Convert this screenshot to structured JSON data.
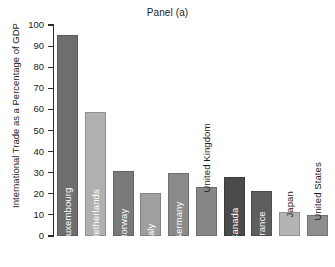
{
  "chart_data": {
    "type": "bar",
    "title": "Panel (a)",
    "xlabel": "",
    "ylabel": "International Trade as a Percentage of GDP",
    "ylim": [
      0,
      100
    ],
    "ytick_step": 10,
    "yticks": [
      100,
      90,
      80,
      70,
      60,
      50,
      40,
      30,
      20,
      10,
      0
    ],
    "grid": false,
    "legend": "none",
    "categories": [
      "Luxembourg",
      "Netherlands",
      "Norway",
      "Italy",
      "Germany",
      "United Kingdom",
      "Canada",
      "France",
      "Japan",
      "United States"
    ],
    "values": [
      95.5,
      59.0,
      31.0,
      20.5,
      29.8,
      23.0,
      27.8,
      21.5,
      11.2,
      10.0
    ],
    "bar_colors": [
      "#6e6e6e",
      "#b0b0b0",
      "#7a7a7a",
      "#9f9f9f",
      "#8a8a8a",
      "#878787",
      "#4a4a4a",
      "#5e5e5e",
      "#b4b4b4",
      "#8e8e8e"
    ],
    "label_placement": [
      "inside",
      "inside",
      "inside",
      "inside",
      "inside",
      "outside",
      "inside",
      "inside",
      "outside",
      "outside"
    ]
  },
  "colors": {
    "background": "#ffffff",
    "axis": "#2b2b2b",
    "text": "#1a1a1a"
  }
}
